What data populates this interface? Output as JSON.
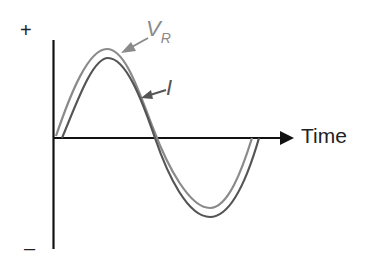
{
  "diagram": {
    "y_axis": {
      "positive_label": "+",
      "negative_label": "–"
    },
    "x_axis": {
      "label": "Time"
    },
    "curves": [
      {
        "name": "V",
        "subscript": "R",
        "color": "#8a8a8a"
      },
      {
        "name": "I",
        "color": "#555555"
      }
    ]
  }
}
